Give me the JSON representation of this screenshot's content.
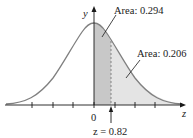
{
  "figure": {
    "type": "normal-distribution-curve",
    "axis_x_label": "z",
    "axis_y_label": "y",
    "origin_label": "0",
    "z_value_label": "z = 0.82",
    "z_value": 0.82,
    "annotations": [
      {
        "label": "Area: 0.294",
        "region": "0 to 0.82"
      },
      {
        "label": "Area: 0.206",
        "region": "0.82 to infinity"
      }
    ],
    "tick_positions": [
      -3,
      -2,
      -1,
      0,
      1,
      2,
      3
    ],
    "colors": {
      "curve": "#808080",
      "axis": "#1a1a1a",
      "dark_area": "#c8c8c8",
      "light_area": "#e4e4e4",
      "dashed_line": "#707070"
    }
  }
}
